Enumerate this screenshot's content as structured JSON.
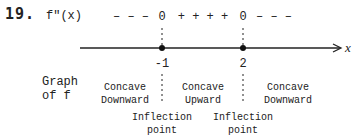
{
  "problem": {
    "number": "19."
  },
  "sign_chart": {
    "function_label": "f″(x)",
    "signs_left": "– – –",
    "zero_1": "0",
    "signs_middle": "+ + + +",
    "zero_2": "0",
    "signs_right": "– – –"
  },
  "axis": {
    "variable": "x",
    "points": [
      {
        "value": "-1",
        "label": "Inflection point"
      },
      {
        "value": "2",
        "label": "Inflection point"
      }
    ]
  },
  "graph_row": {
    "label_line1": "Graph",
    "label_line2": "of f",
    "intervals": [
      {
        "line1": "Concave",
        "line2": "Downward"
      },
      {
        "line1": "Concave",
        "line2": "Upward"
      },
      {
        "line1": "Concave",
        "line2": "Downward"
      }
    ]
  },
  "colors": {
    "ink": "#222222",
    "background": "#ffffff"
  }
}
